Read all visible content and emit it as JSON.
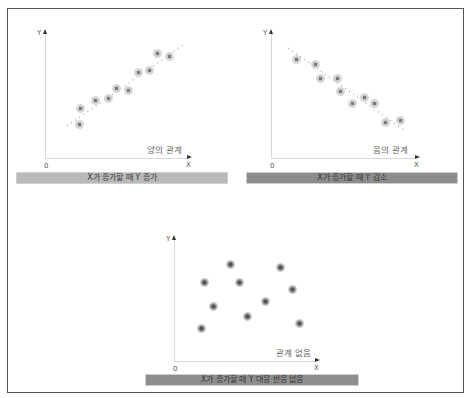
{
  "diagram": {
    "axis_labels": {
      "y": "Y",
      "x": "X",
      "origin": "0"
    },
    "panels": [
      {
        "id": "positive",
        "relation_label": "양의 관계",
        "caption": "X가 증가할 때 Y 증가",
        "caption_color": "#b9b9b9",
        "trend": "increasing",
        "points": [
          [
            79,
            124
          ],
          [
            80,
            108
          ],
          [
            95,
            100
          ],
          [
            108,
            98
          ],
          [
            116,
            88
          ],
          [
            128,
            90
          ],
          [
            138,
            72
          ],
          [
            149,
            70
          ],
          [
            157,
            53
          ],
          [
            169,
            56
          ]
        ]
      },
      {
        "id": "negative",
        "relation_label": "음의 관계",
        "caption": "X가 증가할 때 Y 감소",
        "caption_color": "#8c8c8c",
        "trend": "decreasing",
        "points": [
          [
            296,
            59
          ],
          [
            315,
            64
          ],
          [
            320,
            78
          ],
          [
            337,
            78
          ],
          [
            340,
            91
          ],
          [
            352,
            103
          ],
          [
            364,
            97
          ],
          [
            374,
            103
          ],
          [
            385,
            122
          ],
          [
            400,
            120
          ]
        ]
      },
      {
        "id": "none",
        "relation_label": "관계 없음",
        "caption": "X가 증가할 때 Y 대응 반응 없음",
        "caption_color": "#8e8e8e",
        "trend": "none",
        "points": [
          [
            204,
            282
          ],
          [
            230,
            264
          ],
          [
            239,
            282
          ],
          [
            213,
            306
          ],
          [
            247,
            316
          ],
          [
            265,
            301
          ],
          [
            280,
            267
          ],
          [
            292,
            289
          ],
          [
            299,
            323
          ],
          [
            201,
            328
          ]
        ]
      }
    ]
  }
}
